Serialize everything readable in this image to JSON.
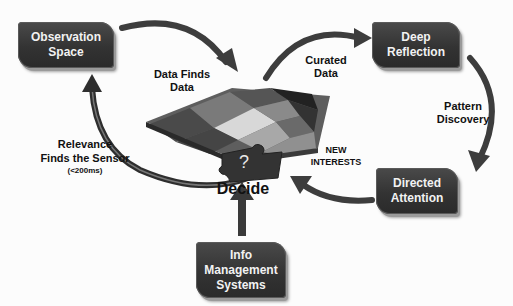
{
  "diagram": {
    "nodes": {
      "observation_space": "Observation\nSpace",
      "deep_reflection": "Deep\nReflection",
      "directed_attention": "Directed\nAttention",
      "info_management": "Info\nManagement\nSystems",
      "decide": "Decide"
    },
    "edge_labels": {
      "data_finds_data": "Data Finds\nData",
      "curated_data": "Curated\nData",
      "pattern_discovery": "Pattern\nDiscovery",
      "new_interests": "NEW\nINTERESTS",
      "relevance": "Relevance\nFinds the Sensor",
      "relevance_timing": "(<200ms)"
    },
    "puzzle_glyph": "?",
    "colors": {
      "box_fill": "#333333",
      "arrow": "#3d3d3d",
      "text": "#111111"
    }
  }
}
